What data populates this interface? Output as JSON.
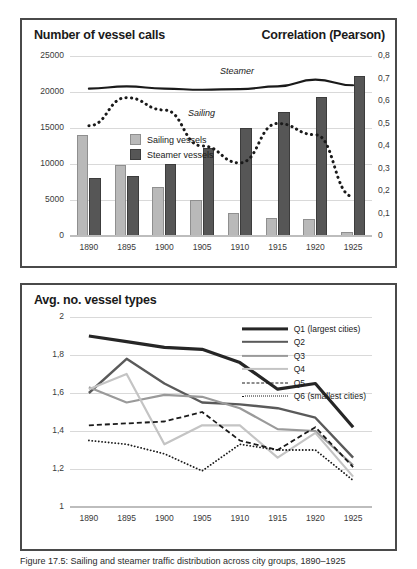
{
  "figure": {
    "caption": "Figure 17.5: Sailing and steamer traffic distribution across city groups, 1890–1925"
  },
  "top_panel": {
    "title_left": "Number of vessel calls",
    "title_right": "Correlation (Pearson)",
    "legend": [
      {
        "key": "sailing",
        "label": "Sailing vessels",
        "color": "#b9b9b9"
      },
      {
        "key": "steamer",
        "label": "Steamer vessels",
        "color": "#565656"
      }
    ],
    "line_labels": {
      "steamer": "Steamer",
      "sailing": "Sailing"
    }
  },
  "bottom_panel": {
    "title": "Avg. no. vessel types",
    "legend": [
      {
        "key": "Q1",
        "label": "Q1 (largest cities)",
        "color": "#262626",
        "style": "solid",
        "width": 3.2
      },
      {
        "key": "Q2",
        "label": "Q2",
        "color": "#5a5a5a",
        "style": "solid",
        "width": 2.4
      },
      {
        "key": "Q3",
        "label": "Q3",
        "color": "#9a9a9a",
        "style": "solid",
        "width": 2.2
      },
      {
        "key": "Q4",
        "label": "Q4",
        "color": "#c4c4c4",
        "style": "solid",
        "width": 2.2
      },
      {
        "key": "Q5",
        "label": "Q5",
        "color": "#1a1a1a",
        "style": "dashed",
        "width": 1.8
      },
      {
        "key": "Q6",
        "label": "Q6 (smallest cities)",
        "color": "#1a1a1a",
        "style": "dotted",
        "width": 1.8
      }
    ]
  },
  "chart_data": [
    {
      "id": "vessel-calls",
      "type": "bar",
      "title": "Number of vessel calls",
      "secondary_title": "Correlation (Pearson)",
      "xlabel": "",
      "ylabel": "Number of vessel calls",
      "y2label": "Correlation (Pearson)",
      "categories": [
        "1890",
        "1895",
        "1900",
        "1905",
        "1910",
        "1915",
        "1920",
        "1925"
      ],
      "ylim": [
        0,
        25000
      ],
      "yticks": [
        "0",
        "5000",
        "10000",
        "15000",
        "20000",
        "25000"
      ],
      "ytick_values": [
        0,
        5000,
        10000,
        15000,
        20000,
        25000
      ],
      "y2lim": [
        0,
        0.8
      ],
      "y2ticks": [
        "0",
        "0,1",
        "0,2",
        "0,3",
        "0,4",
        "0,5",
        "0,6",
        "0,7",
        "0,8"
      ],
      "y2tick_values": [
        0,
        0.1,
        0.2,
        0.3,
        0.4,
        0.5,
        0.6,
        0.7,
        0.8
      ],
      "grid": true,
      "legend_position": "inside-upper-left",
      "series": [
        {
          "name": "Sailing vessels",
          "kind": "bar",
          "axis": "left",
          "color": "#b9b9b9",
          "values": [
            14000,
            9850,
            6750,
            4950,
            3250,
            2450,
            2350,
            600
          ]
        },
        {
          "name": "Steamer vessels",
          "kind": "bar",
          "axis": "left",
          "color": "#565656",
          "values": [
            8100,
            8300,
            9950,
            12200,
            15000,
            17200,
            19300,
            22200
          ]
        },
        {
          "name": "Steamer",
          "kind": "line",
          "axis": "right",
          "color": "#1a1a1a",
          "style": "solid",
          "values": [
            0.655,
            0.665,
            0.655,
            0.65,
            0.653,
            0.665,
            0.695,
            0.67
          ]
        },
        {
          "name": "Sailing",
          "kind": "line",
          "axis": "right",
          "color": "#1a1a1a",
          "style": "dotted",
          "values": [
            0.49,
            0.615,
            0.56,
            0.4,
            0.325,
            0.5,
            0.45,
            0.175
          ]
        }
      ]
    },
    {
      "id": "avg-vessel-types",
      "type": "line",
      "title": "Avg. no. vessel types",
      "xlabel": "",
      "ylabel": "Avg. no. vessel types",
      "categories": [
        "1890",
        "1895",
        "1900",
        "1905",
        "1910",
        "1915",
        "1920",
        "1925"
      ],
      "ylim": [
        1,
        2
      ],
      "yticks": [
        "1",
        "1,2",
        "1,4",
        "1,6",
        "1,8",
        "2"
      ],
      "ytick_values": [
        1,
        1.2,
        1.4,
        1.6,
        1.8,
        2
      ],
      "grid": true,
      "legend_position": "top-right",
      "series": [
        {
          "name": "Q1 (largest cities)",
          "color": "#262626",
          "style": "solid",
          "values": [
            1.9,
            1.87,
            1.84,
            1.83,
            1.76,
            1.62,
            1.65,
            1.42
          ]
        },
        {
          "name": "Q2",
          "color": "#5a5a5a",
          "style": "solid",
          "values": [
            1.6,
            1.78,
            1.65,
            1.55,
            1.54,
            1.52,
            1.47,
            1.26
          ]
        },
        {
          "name": "Q3",
          "color": "#9a9a9a",
          "style": "solid",
          "values": [
            1.63,
            1.55,
            1.59,
            1.58,
            1.52,
            1.41,
            1.4,
            1.22
          ]
        },
        {
          "name": "Q4",
          "color": "#c4c4c4",
          "style": "solid",
          "values": [
            1.62,
            1.7,
            1.33,
            1.43,
            1.43,
            1.26,
            1.39,
            1.16
          ]
        },
        {
          "name": "Q5",
          "color": "#1a1a1a",
          "style": "dashed",
          "values": [
            1.43,
            1.44,
            1.45,
            1.5,
            1.35,
            1.3,
            1.42,
            1.21
          ]
        },
        {
          "name": "Q6 (smallest cities)",
          "color": "#1a1a1a",
          "style": "dotted",
          "values": [
            1.35,
            1.33,
            1.28,
            1.19,
            1.33,
            1.3,
            1.3,
            1.14
          ]
        }
      ]
    }
  ]
}
